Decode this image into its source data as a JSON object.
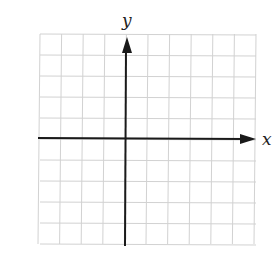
{
  "chart_data": {
    "type": "scatter",
    "title": "",
    "xlabel": "x",
    "ylabel": "y",
    "grid": true,
    "grid_cells": {
      "columns": 10,
      "rows": 10
    },
    "xlim": [
      -4,
      6
    ],
    "ylim": [
      -5,
      5
    ],
    "series": [],
    "axes": {
      "x_arrow": "right",
      "y_arrow": "up"
    }
  },
  "labels": {
    "x": "x",
    "y": "y"
  },
  "colors": {
    "grid": "#d2d2d2",
    "axis": "#1a1a1a",
    "background": "#ffffff"
  }
}
